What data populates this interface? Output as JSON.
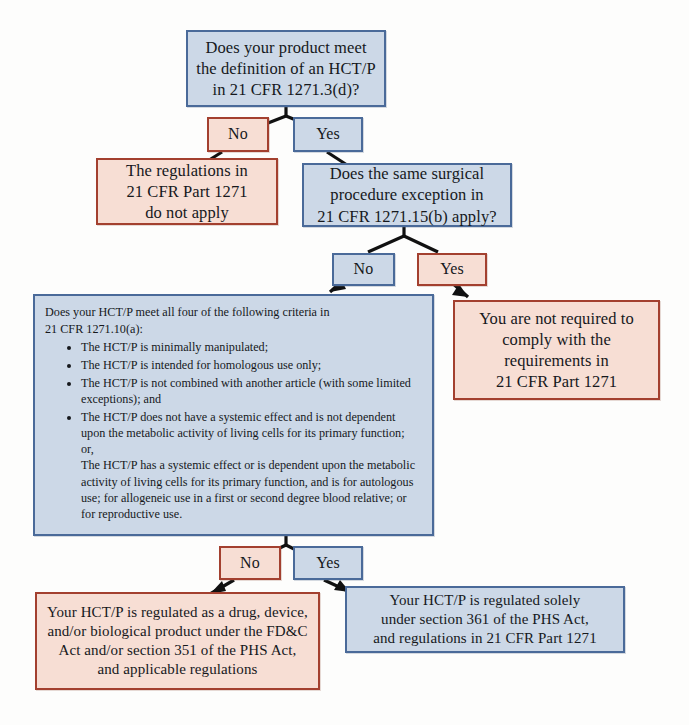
{
  "diagram": {
    "colors": {
      "blue_fill": "#ccd8e7",
      "blue_border": "#4a6a99",
      "red_fill": "#f7ded4",
      "red_border": "#a3402f",
      "text": "#16181c",
      "arrow": "#111111"
    },
    "nodes": {
      "q1": {
        "id": "q1",
        "type": "question",
        "style": "blue",
        "line1": "Does your product meet",
        "line2": "the definition of an HCT/P",
        "line3": "in 21 CFR 1271.3(d)?"
      },
      "q1_no": {
        "id": "q1-no",
        "type": "branch-label",
        "style": "red",
        "label": "No"
      },
      "q1_yes": {
        "id": "q1-yes",
        "type": "branch-label",
        "style": "blue",
        "label": "Yes"
      },
      "out_no_apply": {
        "id": "out-no-apply",
        "type": "outcome",
        "style": "red",
        "line1": "The regulations in",
        "line2": "21 CFR Part 1271",
        "line3": "do not apply"
      },
      "q2": {
        "id": "q2",
        "type": "question",
        "style": "blue",
        "line1": "Does the same surgical",
        "line2": "procedure exception in",
        "line3": "21 CFR 1271.15(b) apply?"
      },
      "q2_no": {
        "id": "q2-no",
        "type": "branch-label",
        "style": "blue",
        "label": "No"
      },
      "q2_yes": {
        "id": "q2-yes",
        "type": "branch-label",
        "style": "red",
        "label": "Yes"
      },
      "out_not_required": {
        "id": "out-not-required",
        "type": "outcome",
        "style": "red",
        "line1": "You are not required to",
        "line2": "comply with the",
        "line3": "requirements in",
        "line4": "21 CFR Part 1271"
      },
      "q3": {
        "id": "q3",
        "type": "question-criteria",
        "style": "blue",
        "lead_line1": "Does your HCT/P meet all four of the following criteria in",
        "lead_line2": "21 CFR 1271.10(a):",
        "bullets": [
          "The HCT/P is minimally manipulated;",
          "The HCT/P is intended for homologous use only;",
          "The HCT/P is not combined with another article (with some limited exceptions); and",
          "The HCT/P does not have a systemic effect and is not dependent upon the metabolic activity of living cells for its primary function;"
        ],
        "bullet4_or": "or,",
        "bullet4_alt": "The HCT/P has a systemic effect or is dependent upon the metabolic activity of living cells for its primary function, and is for autologous use; for allogeneic use in a first or second degree blood relative; or for reproductive use."
      },
      "q3_no": {
        "id": "q3-no",
        "type": "branch-label",
        "style": "red",
        "label": "No"
      },
      "q3_yes": {
        "id": "q3-yes",
        "type": "branch-label",
        "style": "blue",
        "label": "Yes"
      },
      "out_drug_device": {
        "id": "out-drug-device",
        "type": "outcome",
        "style": "red",
        "line1": "Your HCT/P is regulated as a drug, device,",
        "line2": "and/or biological product under the FD&C",
        "line3": "Act and/or section 351 of the PHS Act,",
        "line4": "and applicable regulations"
      },
      "out_361": {
        "id": "out-361",
        "type": "outcome",
        "style": "blue",
        "line1": "Your HCT/P is regulated solely",
        "line2": "under section 361 of the PHS Act,",
        "line3": "and regulations in 21 CFR Part 1271"
      }
    }
  }
}
